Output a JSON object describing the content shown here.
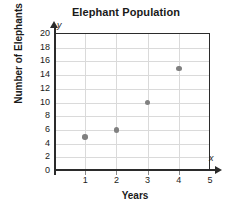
{
  "chart_data": {
    "type": "scatter",
    "title": "Elephant Population",
    "xlabel": "Years",
    "ylabel": "Number of Elephants",
    "x": [
      1,
      2,
      3,
      4
    ],
    "values": [
      5,
      6,
      10,
      15
    ],
    "points": [
      {
        "x": 1,
        "y": 5
      },
      {
        "x": 2,
        "y": 6
      },
      {
        "x": 3,
        "y": 10
      },
      {
        "x": 4,
        "y": 15
      }
    ],
    "xlim": [
      0,
      5
    ],
    "ylim": [
      0,
      20
    ],
    "xticks": [
      1,
      2,
      3,
      4,
      5
    ],
    "yticks": [
      0,
      2,
      4,
      6,
      8,
      10,
      12,
      14,
      16,
      18,
      20
    ],
    "xtick_labels": [
      "1",
      "2",
      "3",
      "4",
      "5"
    ],
    "ytick_labels": [
      "0",
      "2",
      "4",
      "6",
      "8",
      "10",
      "12",
      "14",
      "16",
      "18",
      "20"
    ],
    "grid": true,
    "legend": null,
    "x_axis_letter": "x",
    "y_axis_letter": "y",
    "marker_color": "#808080",
    "grid_color": "#dadada",
    "axis_color": "#2b2b2b"
  }
}
